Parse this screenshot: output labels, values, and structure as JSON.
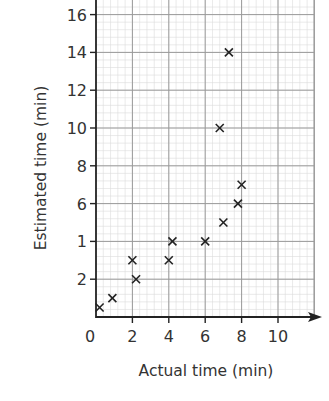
{
  "chart_data": {
    "type": "scatter",
    "title": "",
    "xlabel": "Actual time (min)",
    "ylabel": "Estimated time (min)",
    "xlim": [
      0,
      11.5
    ],
    "ylim": [
      0,
      16.5
    ],
    "x_ticks": [
      0,
      2,
      4,
      6,
      8,
      10
    ],
    "y_ticks": [
      2,
      4,
      6,
      8,
      10,
      12,
      14,
      16
    ],
    "x_tick_labels": [
      "0",
      "2",
      "4",
      "6",
      "8",
      "10"
    ],
    "y_tick_labels": [
      "2",
      "1",
      "6",
      "8",
      "10",
      "12",
      "14",
      "16"
    ],
    "grid": true,
    "grid_minor_step": 0.4,
    "marker": "x",
    "legend": null,
    "points": [
      {
        "x": 0.2,
        "y": 0.5
      },
      {
        "x": 0.9,
        "y": 1
      },
      {
        "x": 2,
        "y": 3
      },
      {
        "x": 2.2,
        "y": 2
      },
      {
        "x": 4,
        "y": 3
      },
      {
        "x": 4.2,
        "y": 4
      },
      {
        "x": 6,
        "y": 4
      },
      {
        "x": 6.8,
        "y": 10
      },
      {
        "x": 7,
        "y": 5
      },
      {
        "x": 7.3,
        "y": 14
      },
      {
        "x": 7.8,
        "y": 6
      },
      {
        "x": 8,
        "y": 7
      }
    ]
  },
  "colors": {
    "axis": "#222222",
    "major_grid": "#9a9a9a",
    "minor_grid": "#dcdcdc",
    "marker": "#222222",
    "text": "#333333"
  }
}
